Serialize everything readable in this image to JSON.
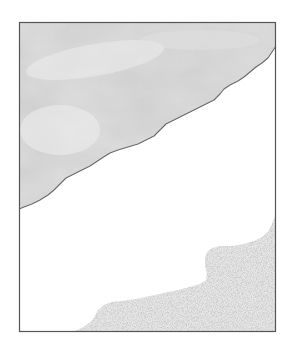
{
  "figure": {
    "type": "schematic-map",
    "frame": {
      "x": 19,
      "y": 22,
      "width": 257,
      "height": 310,
      "stroke": "#555555"
    },
    "regions": [
      {
        "name": "upper-region",
        "fill_style": "mottled-gray",
        "colors": {
          "base": "#cfcfcf",
          "light": "#e6e6e6",
          "dark": "#b8b8b8",
          "edge": "#6a6a6a"
        }
      },
      {
        "name": "middle-region",
        "fill_style": "blank",
        "colors": {
          "base": "#ffffff"
        }
      },
      {
        "name": "lower-right-region",
        "fill_style": "stippled-dots",
        "colors": {
          "dot": "#7a7a7a",
          "base": "#ffffff"
        }
      }
    ],
    "labels": []
  }
}
